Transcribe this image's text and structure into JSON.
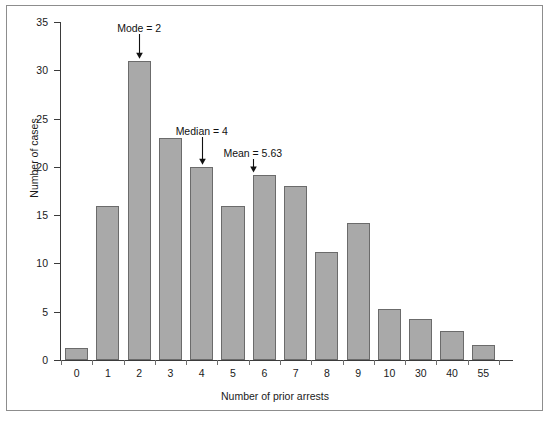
{
  "chart_data": {
    "type": "bar",
    "title": "",
    "xlabel": "Number of prior arrests",
    "ylabel": "Number of cases",
    "categories": [
      "0",
      "1",
      "2",
      "3",
      "4",
      "5",
      "6",
      "7",
      "8",
      "9",
      "10",
      "30",
      "40",
      "55"
    ],
    "values": [
      1.2,
      16,
      31,
      23,
      20,
      16,
      19.2,
      18,
      11.2,
      14.2,
      5.3,
      4.2,
      3,
      1.6
    ],
    "ylim": [
      0,
      35
    ],
    "yticks": [
      0,
      5,
      10,
      15,
      20,
      25,
      30,
      35
    ],
    "ytick_labels": [
      "0",
      "5",
      "10",
      "15",
      "20",
      "25",
      "30",
      "35"
    ],
    "grid": false,
    "legend": null,
    "bar_color": "#a9a9a9",
    "bar_edge_color": "#6b6b6b",
    "axis_color": "#3b3b3b",
    "annotations": [
      {
        "label": "Mode = 2",
        "value": 2,
        "category": "2"
      },
      {
        "label": "Median = 4",
        "value": 4,
        "category": "4"
      },
      {
        "label": "Mean = 5.63",
        "value": 5.63,
        "category": "5.63"
      }
    ]
  }
}
